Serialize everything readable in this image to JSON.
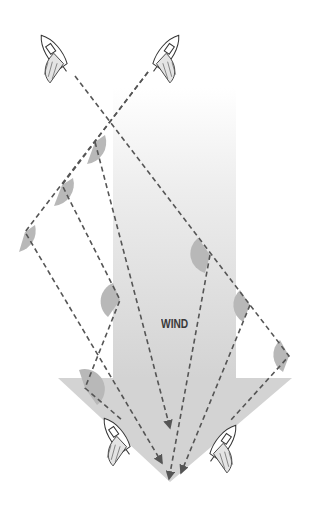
{
  "diagram": {
    "label": "WIND",
    "colors": {
      "arrow_fill": "#d3d3d3",
      "arrow_top": "#ffffff",
      "dash": "#555555",
      "wedge": "#b5b5b5",
      "boat_line": "#333333"
    },
    "wind_arrow": {
      "shaft": {
        "x1": 113,
        "x2": 236,
        "top": 88,
        "bottom": 378
      },
      "head": {
        "left": 58,
        "right": 292,
        "top": 378,
        "tip_x": 170,
        "tip_y": 482
      }
    },
    "boats": [
      {
        "id": "top-left",
        "x": 55,
        "y": 55,
        "rotation": -35
      },
      {
        "id": "top-right",
        "x": 165,
        "y": 55,
        "rotation": 35
      },
      {
        "id": "bottom-left",
        "x": 118,
        "y": 438,
        "rotation": -35
      },
      {
        "id": "bottom-right",
        "x": 222,
        "y": 445,
        "rotation": 35
      }
    ],
    "tack_corners": [
      {
        "x": 95,
        "y": 142
      },
      {
        "x": 62,
        "y": 185
      },
      {
        "x": 25,
        "y": 232
      },
      {
        "x": 120,
        "y": 300
      },
      {
        "x": 85,
        "y": 388
      },
      {
        "x": 210,
        "y": 255
      },
      {
        "x": 250,
        "y": 305
      },
      {
        "x": 289,
        "y": 356
      }
    ],
    "courses": [
      {
        "name": "starboard-lift-left",
        "points": [
          [
            75,
            76
          ],
          [
            289,
            356
          ],
          [
            231,
            420
          ]
        ]
      },
      {
        "name": "port-long-left",
        "points": [
          [
            148,
            72
          ],
          [
            25,
            232
          ],
          [
            162,
            463
          ]
        ]
      },
      {
        "name": "port-mid",
        "points": [
          [
            148,
            72
          ],
          [
            62,
            185
          ],
          [
            120,
            300
          ],
          [
            85,
            388
          ],
          [
            122,
            420
          ]
        ]
      },
      {
        "name": "port-short",
        "points": [
          [
            148,
            72
          ],
          [
            95,
            142
          ],
          [
            170,
            428
          ]
        ]
      },
      {
        "name": "starboard-mid",
        "points": [
          [
            75,
            76
          ],
          [
            250,
            305
          ],
          [
            181,
            473
          ]
        ]
      },
      {
        "name": "starboard-short",
        "points": [
          [
            75,
            76
          ],
          [
            210,
            255
          ],
          [
            169,
            479
          ]
        ]
      }
    ]
  }
}
